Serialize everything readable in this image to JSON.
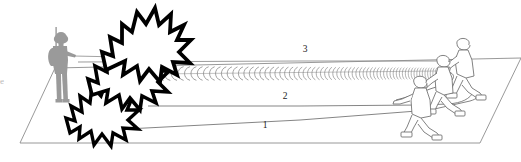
{
  "figure": {
    "background_color": "#ffffff",
    "width": 521,
    "height": 162
  },
  "ground_plane": {
    "name": "ground-plane",
    "stroke_color": "#8d8d8d",
    "fill_color": "#ffffff",
    "points": "20,143 55,68 521,58 480,143"
  },
  "callouts": [
    {
      "id": "1",
      "label": "1",
      "x": 265,
      "y": 126,
      "meaning": "firing-wire-lower"
    },
    {
      "id": "2",
      "label": "2",
      "x": 285,
      "y": 97,
      "meaning": "firing-wire-middle"
    },
    {
      "id": "3",
      "label": "3",
      "x": 305,
      "y": 50,
      "meaning": "coiled-detonating-cord"
    }
  ],
  "edge_text": {
    "fragment": "e",
    "x": 0,
    "y": 82
  },
  "soldier": {
    "name": "standing-soldier-silhouette",
    "fill_color": "#9a9a9a",
    "x": 42,
    "y": 28
  },
  "explosions": {
    "name": "explosion-burst-group",
    "count": 3,
    "stroke_color": "#000000",
    "fill_color": "#ffffff"
  },
  "crew": {
    "name": "kneeling-crew-group",
    "count": 3,
    "stroke_color": "#6b6b6b",
    "fill_color": "#ffffff"
  },
  "lines": {
    "coil_stroke": "#7a7a7a",
    "wire_stroke": "#6f6f6f"
  }
}
